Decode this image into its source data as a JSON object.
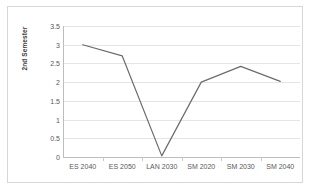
{
  "chart_data": {
    "type": "line",
    "title": "",
    "xlabel": "",
    "ylabel": "2nd Semester",
    "categories": [
      "ES 2040",
      "ES 2050",
      "LAN 2030",
      "SM 2020",
      "SM 2030",
      "SM 2040"
    ],
    "values": [
      3.0,
      2.7,
      0.03,
      2.0,
      2.42,
      2.02
    ],
    "series": [
      {
        "name": "2nd Semester",
        "values": [
          3.0,
          2.7,
          0.03,
          2.0,
          2.42,
          2.02
        ]
      }
    ],
    "ylim": [
      0,
      3.5
    ],
    "ytick_labels": [
      "3.5",
      "3",
      "2.5",
      "2",
      "1.5",
      "1",
      "0.5",
      "0"
    ],
    "ytick_values": [
      3.5,
      3,
      2.5,
      2,
      1.5,
      1,
      0.5,
      0
    ],
    "grid": true,
    "legend": "none",
    "line_color": "#6b6b6b",
    "grid_color": "#e4e4e4",
    "axis_color": "#bdbdbd",
    "background_color": "#ffffff",
    "border_color": "#d6d6d6"
  }
}
